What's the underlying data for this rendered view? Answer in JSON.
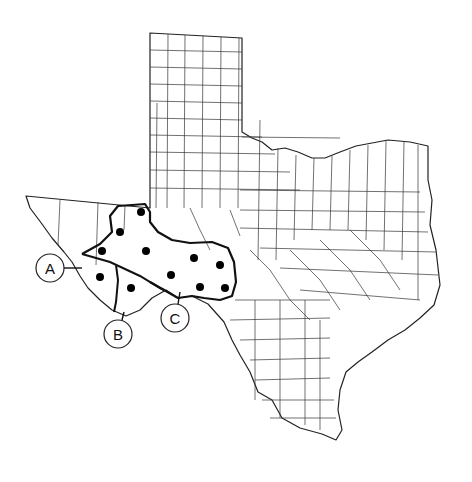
{
  "map": {
    "subject": "Texas county map",
    "region_labels": [
      {
        "id": "A",
        "text": "A",
        "cx": 50,
        "cy": 268
      },
      {
        "id": "B",
        "text": "B",
        "cx": 118,
        "cy": 334
      },
      {
        "id": "C",
        "text": "C",
        "cx": 175,
        "cy": 318
      }
    ],
    "dots": [
      [
        141,
        212
      ],
      [
        120,
        232
      ],
      [
        102,
        251
      ],
      [
        146,
        251
      ],
      [
        100,
        277
      ],
      [
        131,
        288
      ],
      [
        171,
        275
      ],
      [
        194,
        258
      ],
      [
        220,
        265
      ],
      [
        200,
        287
      ],
      [
        225,
        288
      ]
    ],
    "colors": {
      "line": "#222222",
      "background": "#ffffff",
      "dot": "#000000"
    }
  }
}
